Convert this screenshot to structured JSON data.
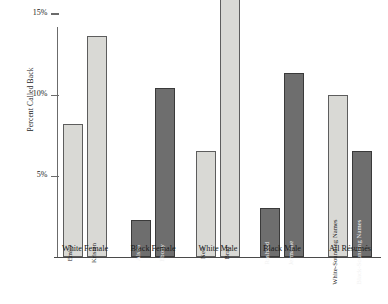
{
  "chart_data": {
    "type": "bar",
    "title": "",
    "xlabel": "",
    "ylabel": "Percent Called Back",
    "ylim": [
      0,
      17
    ],
    "grid": false,
    "legend": "none",
    "y_ticks": [
      {
        "value": 15,
        "label": "15%"
      },
      {
        "value": 10,
        "label": "10%"
      },
      {
        "value": 5,
        "label": "5%"
      }
    ],
    "groups": [
      {
        "label": "White Female",
        "bars": [
          0,
          1
        ]
      },
      {
        "label": "Black Female",
        "bars": [
          2,
          3
        ]
      },
      {
        "label": "White Male",
        "bars": [
          4,
          5
        ]
      },
      {
        "label": "Black Male",
        "bars": [
          6,
          7
        ]
      },
      {
        "label": "All Résumés",
        "bars": [
          8,
          9
        ]
      }
    ],
    "categories": [
      "Emily",
      "Kristen",
      "Aisha",
      "Ebony",
      "Neil",
      "Brad",
      "Rasheed",
      "Jermaine",
      "White-Sounding Names",
      "Black-Sounding Names"
    ],
    "values": [
      8.2,
      13.6,
      2.3,
      10.4,
      6.5,
      16.0,
      3.0,
      11.3,
      10.0,
      6.5
    ],
    "shades": [
      "light",
      "light",
      "dark",
      "dark",
      "light",
      "light",
      "dark",
      "dark",
      "light",
      "dark"
    ],
    "colors": {
      "light_fill": "#d9d9d5",
      "light_stroke": "#5d5d5d",
      "dark_fill": "#6e6e6e",
      "dark_stroke": "#3a3a3a",
      "axis": "#6b6b6b",
      "text": "#1a1a1a",
      "background": "#ffffff"
    }
  }
}
